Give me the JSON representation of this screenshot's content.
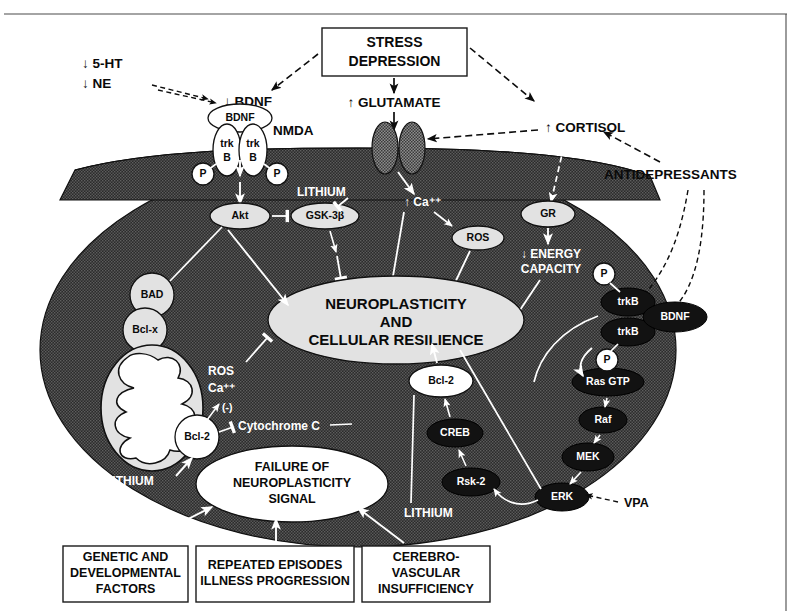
{
  "figure": {
    "colors": {
      "cell_fill": "#3a3a3a",
      "node_light": "#e2e2e2",
      "node_dark": "#121212",
      "text_dark": "#0a0a0a",
      "text_light": "#ffffff",
      "frame": "#4a4a4a"
    }
  },
  "extracellular": {
    "monoamines": {
      "serotonin": "↓ 5-HT",
      "norepinephrine": "↓ NE"
    },
    "bdnf_reduced": "↓ BDNF",
    "bdnf_ligand": "BDNF",
    "stress_box": {
      "line1": "STRESS",
      "line2": "DEPRESSION"
    },
    "glutamate": "↑ GLUTAMATE",
    "nmda": "NMDA",
    "cortisol": "↑ CORTISOL",
    "antidepressants": "ANTIDEPRESSANTS"
  },
  "receptor": {
    "trk_left_line1": "trk",
    "trk_left_line2": "B",
    "trk_right_line1": "trk",
    "trk_right_line2": "B",
    "phospho_left": "P",
    "phospho_right": "P"
  },
  "intracellular": {
    "akt": "Akt",
    "gsk3b": "GSK-3β",
    "lithium_gsk": "LITHIUM",
    "calcium": "↑ Ca⁺⁺",
    "ros": "ROS",
    "gr": "GR",
    "energy_capacity": {
      "line1": "↓ ENERGY",
      "line2": "CAPACITY"
    },
    "bad": "BAD",
    "bclx": "Bcl-x",
    "bcl2_mito": "Bcl-2",
    "ros_ca_label": {
      "line1": "ROS",
      "line2": "Ca⁺⁺"
    },
    "negative_sign": "(-)",
    "cytochrome_c": "Cytochrome C",
    "lithium_vpa": {
      "line1": "LITHIUM",
      "line2": "VPA"
    },
    "center_ellipse": {
      "line1": "NEUROPLASTICITY",
      "line2": "AND",
      "line3": "CELLULAR RESILIENCE"
    },
    "failure_ellipse": {
      "line1": "FAILURE OF",
      "line2": "NEUROPLASTICITY",
      "line3": "SIGNAL"
    },
    "bcl2_creb": "Bcl-2",
    "creb": "CREB",
    "rsk2": "Rsk-2",
    "erk": "ERK",
    "mek": "MEK",
    "raf": "Raf",
    "ras_gtp": "Ras GTP",
    "trkb_upper": "trkB",
    "trkb_lower": "trkB",
    "bdnf_right": "BDNF",
    "phospho_upper_right": "P",
    "phospho_lower_right": "P",
    "lithium_bottom": "LITHIUM",
    "vpa_erk": "VPA"
  },
  "bottom_boxes": [
    {
      "id": "genetic",
      "line1": "GENETIC AND",
      "line2": "DEVELOPMENTAL",
      "line3": "FACTORS"
    },
    {
      "id": "episodes",
      "line1": "REPEATED EPISODES",
      "line2": "ILLNESS PROGRESSION",
      "line3": ""
    },
    {
      "id": "vascular",
      "line1": "CEREBRO-",
      "line2": "VASCULAR",
      "line3": "INSUFFICIENCY"
    }
  ]
}
